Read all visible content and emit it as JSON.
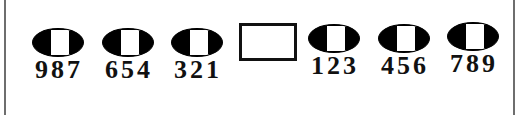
{
  "puzzle": {
    "left_items": [
      {
        "digits": "987"
      },
      {
        "digits": "654"
      },
      {
        "digits": "321"
      }
    ],
    "answer_box": {
      "value": ""
    },
    "right_items": [
      {
        "digits": "123"
      },
      {
        "digits": "456"
      },
      {
        "digits": "789"
      }
    ]
  }
}
